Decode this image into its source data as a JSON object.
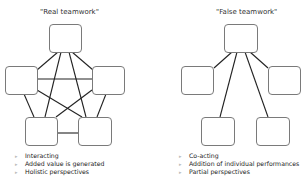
{
  "diagrams": [
    {
      "title": "\"Real teamwork\"",
      "bullets": [
        "Interacting",
        "Added value is generated",
        "Holistic perspectives"
      ]
    },
    {
      "title": "\"False teamwork\"",
      "bullets": [
        "Co-acting",
        "Addition of individual performances",
        "Partial perspectives"
      ]
    }
  ],
  "bullet_glyph": "▸",
  "colors": {
    "node_border": "#7a7a7a",
    "line": "#222222",
    "bullet": "#bbbbbb"
  }
}
